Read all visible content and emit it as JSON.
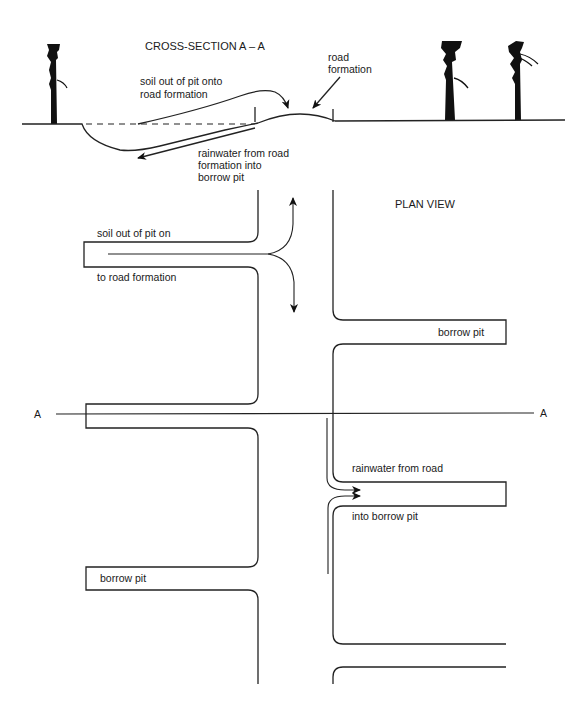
{
  "cross_section": {
    "title": "CROSS-SECTION A – A",
    "labels": {
      "soil_line1": "soil out of pit onto",
      "soil_line2": "road formation",
      "road_line1": "road",
      "road_line2": "formation",
      "rain_line1": "rainwater from road",
      "rain_line2": "formation into",
      "rain_line3": "borrow pit"
    }
  },
  "plan_view": {
    "title": "PLAN VIEW",
    "labels": {
      "soil_line1": "soil out of pit on",
      "soil_line2": "to road formation",
      "borrow_pit_upper_right": "borrow pit",
      "section_marker_left": "A",
      "section_marker_right": "A",
      "rain_line1": "rainwater from road",
      "rain_line2": "into borrow pit",
      "borrow_pit_lower_left": "borrow pit"
    }
  },
  "colors": {
    "line": "#222222",
    "background": "#ffffff"
  }
}
